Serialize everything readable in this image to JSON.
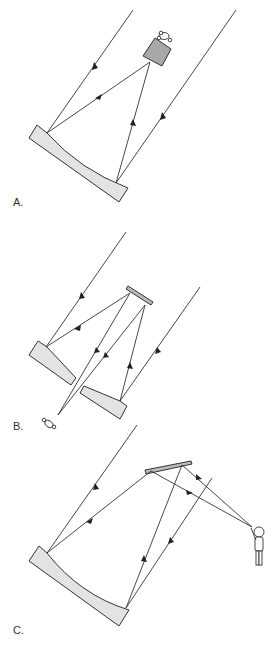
{
  "figure": {
    "panels": [
      {
        "id": "A",
        "label": "A.",
        "description": "Prime focus: incoming parallel rays reflect off concave primary mirror to an eyepiece/detector at top"
      },
      {
        "id": "B",
        "label": "B.",
        "description": "Cassegrain: rays reflect off two primary mirror segments onto a small secondary mirror and back through the gap to the observer"
      },
      {
        "id": "C",
        "label": "C.",
        "description": "Newtonian-style: primary mirror reflects to a flat secondary mirror which directs light to a standing observer"
      }
    ],
    "colors": {
      "mirror_fill": "#e3e3e3",
      "secondary_fill": "#bbbbbb",
      "eyepiece_fill": "#a8a8a8",
      "line": "#333333"
    }
  }
}
